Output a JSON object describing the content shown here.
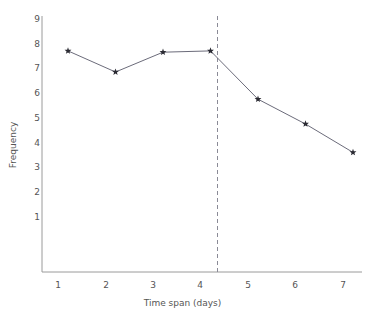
{
  "chart_data": {
    "type": "line",
    "title": "",
    "xlabel": "Time span (days)",
    "ylabel": "Frequency",
    "x": [
      1,
      2,
      3,
      4,
      5,
      6,
      7
    ],
    "values": [
      7.75,
      6.9,
      7.7,
      7.75,
      5.8,
      4.8,
      3.65
    ],
    "series": [
      {
        "name": "Frequency",
        "values": [
          7.75,
          6.9,
          7.7,
          7.75,
          5.8,
          4.8,
          3.65
        ]
      }
    ],
    "xtick_labels": [
      "1",
      "2",
      "3",
      "4",
      "5",
      "6",
      "7"
    ],
    "ytick_labels": [
      "1",
      "2",
      "3",
      "4",
      "5",
      "6",
      "7",
      "8",
      "9"
    ],
    "xlim": [
      0.6,
      7.4
    ],
    "ylim": [
      0,
      9.3
    ],
    "grid": false,
    "legend": null,
    "marker": "star",
    "line_color": "#6b6b7a",
    "marker_color": "#2b2b33",
    "axis_color": "#9a9a9a",
    "text_color": "#555555",
    "annotations": [
      {
        "type": "vertical-reference-line",
        "x": 4,
        "style": "dashed",
        "color": "#8a8a96"
      }
    ]
  }
}
